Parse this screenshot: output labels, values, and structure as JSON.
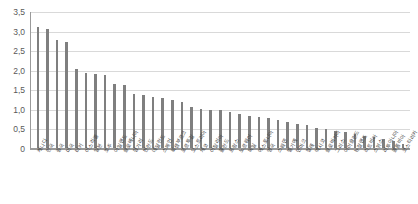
{
  "chart_data": {
    "type": "bar",
    "title": "",
    "subtitle": "",
    "xlabel": "",
    "ylabel": "",
    "ylim": [
      0,
      3.5
    ],
    "ytick_labels": [
      "3,5",
      "3,0",
      "2,5",
      "2,0",
      "1,5",
      "1,0",
      "0,5",
      "0"
    ],
    "ytick_values": [
      3.5,
      3.0,
      2.5,
      2.0,
      1.5,
      1.0,
      0.5,
      0
    ],
    "decimal_separator": ",",
    "grid": "horizontal",
    "legend": "none",
    "bar_color": "#7f7f7f",
    "gridline_color": "#d9d9d9",
    "axis_color": "#9a9a9a",
    "tick_label_color": "#595959",
    "sorted": "descending",
    "categories": [
      "캐나다",
      "한국",
      "중국",
      "미국",
      "터키",
      "이스라엘",
      "일본",
      "호주",
      "아일랜드",
      "슬로베니아",
      "헝가리",
      "핀란드",
      "네덜란드",
      "스페인",
      "룩셈부르크",
      "포르투갈",
      "오스트리아",
      "체코",
      "이탈리아",
      "폴란드",
      "프랑스",
      "노르웨이",
      "독일",
      "에스토니아",
      "영국",
      "스웨덴",
      "벨기에",
      "덴마크",
      "칠레",
      "멕시코",
      "슬로바키아",
      "그리스",
      "아이슬란드",
      "뉴질랜드",
      "라트비아",
      "스위스",
      "리투아니아",
      "콜롬비아",
      "코스타리카"
    ],
    "values": [
      3.1,
      3.05,
      2.77,
      2.71,
      2.01,
      1.92,
      1.88,
      1.87,
      1.63,
      1.6,
      1.37,
      1.36,
      1.3,
      1.27,
      1.22,
      1.17,
      1.05,
      1.0,
      0.97,
      0.96,
      0.93,
      0.87,
      0.83,
      0.8,
      0.76,
      0.71,
      0.66,
      0.62,
      0.58,
      0.52,
      0.48,
      0.44,
      0.4,
      0.35,
      0.31,
      0.27,
      0.23,
      0.18,
      0.09
    ]
  }
}
